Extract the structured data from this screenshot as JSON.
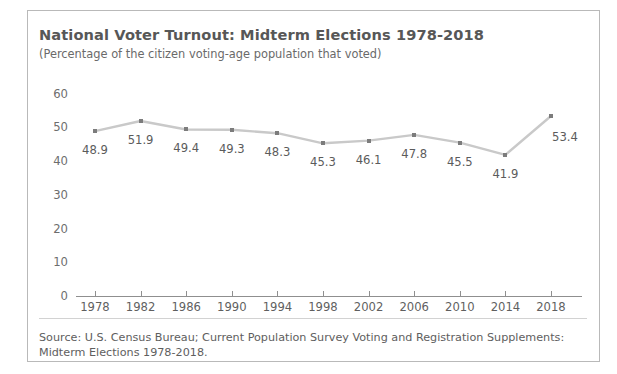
{
  "chart_data": {
    "type": "line",
    "title": "National Voter Turnout: Midterm Elections 1978-2018",
    "subtitle": "(Percentage of the citizen voting-age population that voted)",
    "xlabel": "",
    "ylabel": "",
    "categories": [
      "1978",
      "1982",
      "1986",
      "1990",
      "1994",
      "1998",
      "2002",
      "2006",
      "2010",
      "2014",
      "2018"
    ],
    "values": [
      48.9,
      51.9,
      49.4,
      49.3,
      48.3,
      45.3,
      46.1,
      47.8,
      45.5,
      41.9,
      53.4
    ],
    "data_labels": [
      "48.9",
      "51.9",
      "49.4",
      "49.3",
      "48.3",
      "45.3",
      "46.1",
      "47.8",
      "45.5",
      "41.9",
      "53.4"
    ],
    "ylim": [
      0,
      62
    ],
    "yticks": [
      0,
      10,
      20,
      30,
      40,
      50,
      60
    ],
    "ytick_labels": [
      "0",
      "10",
      "20",
      "30",
      "40",
      "50",
      "60"
    ],
    "grid": false,
    "legend": "none",
    "line_color": "#c9c9c9",
    "marker_color": "#7c7c7c",
    "text_color": "#5b5b5b"
  },
  "footer": {
    "line1": "Source: U.S. Census Bureau; Current Population Survey Voting and Registration Supplements:",
    "line2": "Midterm Elections 1978-2018."
  }
}
